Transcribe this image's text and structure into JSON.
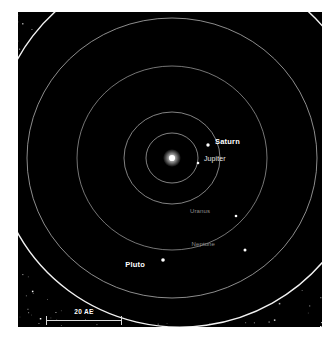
{
  "figure": {
    "background_color": "#ffffff",
    "panel_color": "#000000"
  },
  "chart_data": {
    "type": "scatter",
    "xlabel": "",
    "ylabel": "",
    "units": "AE",
    "grid": false,
    "legend_position": "none",
    "scale_bar": {
      "label": "20 AE",
      "length_au": 20,
      "length_px": 76
    },
    "center": {
      "name": "Sun",
      "x_px": 154,
      "y_px": 146,
      "color": "#ffffff",
      "radius_px": 3
    },
    "orbits": [
      {
        "name": "Jupiter",
        "semimajor_au": 5.2,
        "rx_px": 26,
        "ry_px": 25,
        "cx_px": 154,
        "cy_px": 146,
        "color": "#b9b9b9",
        "linewidth": 0.7
      },
      {
        "name": "Saturn",
        "semimajor_au": 9.5,
        "rx_px": 48,
        "ry_px": 46,
        "cx_px": 154,
        "cy_px": 146,
        "color": "#b9b9b9",
        "linewidth": 0.7
      },
      {
        "name": "Uranus",
        "semimajor_au": 19.2,
        "rx_px": 95,
        "ry_px": 92,
        "cx_px": 154,
        "cy_px": 146,
        "color": "#a8a8a8",
        "linewidth": 0.7
      },
      {
        "name": "Neptune",
        "semimajor_au": 30.1,
        "rx_px": 145,
        "ry_px": 140,
        "cx_px": 154,
        "cy_px": 146,
        "color": "#b0b0b0",
        "linewidth": 0.8
      },
      {
        "name": "Pluto",
        "semimajor_au": 39.5,
        "rx_px": 186,
        "ry_px": 182,
        "cx_px": 163,
        "cy_px": 133,
        "color": "#f2f2f2",
        "linewidth": 1.4,
        "rotation_deg": -8,
        "eccentric": true
      }
    ],
    "bodies": [
      {
        "name": "Saturn",
        "label": "Saturn",
        "x_px": 190,
        "y_px": 133,
        "marker_px": 3.4,
        "label_style": "bright",
        "label_dx": 7,
        "label_dy": -4
      },
      {
        "name": "Jupiter",
        "label": "Jupiter",
        "x_px": 180,
        "y_px": 151,
        "marker_px": 2.6,
        "label_style": "mid",
        "label_dx": 6,
        "label_dy": -4
      },
      {
        "name": "Uranus",
        "label": "Uranus",
        "x_px": 218,
        "y_px": 204,
        "marker_px": 2.6,
        "label_style": "dim",
        "label_dx": -26,
        "label_dy": -4
      },
      {
        "name": "Neptune",
        "label": "Neptune",
        "x_px": 227,
        "y_px": 238,
        "marker_px": 3.0,
        "label_style": "dim",
        "label_dx": -30,
        "label_dy": -5
      },
      {
        "name": "Pluto",
        "label": "Pluto",
        "x_px": 145,
        "y_px": 248,
        "marker_px": 3.6,
        "label_style": "bright",
        "label_dx": -18,
        "label_dy": 4
      }
    ],
    "kuiper_belt": {
      "description": "Dense field of small white points outside the Pluto orbit",
      "point_count": 1700,
      "inner_radius_au": 30,
      "outer_radius_au": 55,
      "color": "#ffffff"
    }
  },
  "labels": {
    "saturn": "Saturn",
    "jupiter": "Jupiter",
    "uranus": "Uranus",
    "neptune": "Neptune",
    "pluto": "Pluto",
    "scale": "20 AE"
  }
}
